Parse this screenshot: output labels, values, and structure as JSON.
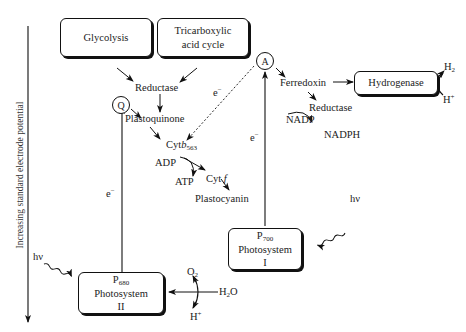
{
  "axis": {
    "label": "Increasing standard electrode potential",
    "direction": "down"
  },
  "boxes": {
    "glycolysis": "Glycolysis",
    "tca_line1": "Tricarboxylic",
    "tca_line2": "acid cycle",
    "hydrogenase": "Hydrogenase",
    "ps1_p": "P",
    "ps1_sub": "700",
    "ps1_line2": "Photosystem",
    "ps1_line3": "I",
    "ps2_p": "P",
    "ps2_sub": "680",
    "ps2_line2": "Photosystem",
    "ps2_line3": "II"
  },
  "nodes": {
    "reductase_top": "Reductase",
    "q_circle": "Q",
    "a_circle": "A",
    "plastoquinone": "Plastoquinone",
    "cyt_b": "Cyt",
    "cyt_b_italic": "b",
    "cyt_b_sub": "563",
    "adp": "ADP",
    "atp": "ATP",
    "cyt_f": "Cyt",
    "cyt_f_italic": "f",
    "plastocyanin": "Plastocyanin",
    "ferredoxin": "Ferredoxin",
    "reductase_right": "Reductase",
    "nadp": "NADP",
    "nadph": "NADPH",
    "h2": "H",
    "h2_sub": "2",
    "hplus_right": "H",
    "hplus_right_sup": "+",
    "o2": "O",
    "o2_sub": "2",
    "h2o_h": "H",
    "h2o_sub": "2",
    "h2o_o": "O",
    "hplus_bottom": "H",
    "hplus_bottom_sup": "+",
    "hv_left": "hν",
    "hv_right": "hν",
    "e_dashed": "e",
    "e_left": "e",
    "e_right": "e",
    "e_sup": "−"
  }
}
